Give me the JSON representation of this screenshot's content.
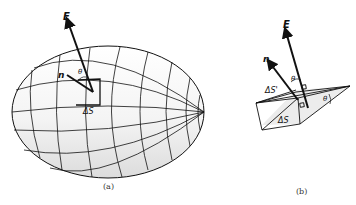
{
  "figure_a": {
    "caption": "(a)",
    "labels": {
      "field": "E",
      "normal": "n",
      "angle": "θ",
      "area": "ΔS"
    }
  },
  "figure_b": {
    "caption": "(b)",
    "labels": {
      "field": "E",
      "normal": "n",
      "angle_top": "θ",
      "angle_side": "θ",
      "area_projected": "ΔS'",
      "area": "ΔS"
    }
  },
  "colors": {
    "line": "#111111",
    "shade": "#e8e8e8",
    "background": "#ffffff"
  }
}
